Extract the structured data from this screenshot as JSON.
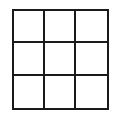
{
  "diagram": {
    "type": "grid",
    "rows": 3,
    "columns": 3,
    "line_color": "#1a1a1a",
    "background": "#ffffff",
    "cells": [
      [
        "",
        "",
        ""
      ],
      [
        "",
        "",
        ""
      ],
      [
        "",
        "",
        ""
      ]
    ]
  }
}
